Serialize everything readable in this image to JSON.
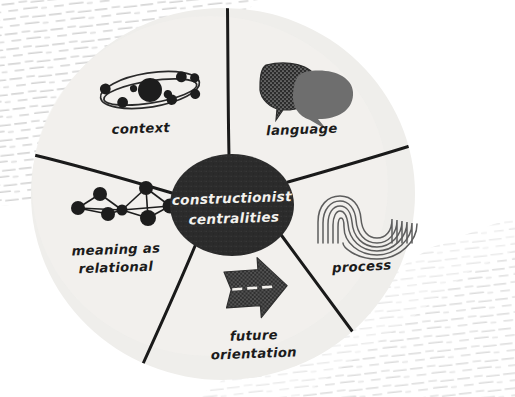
{
  "diagram": {
    "title": "constructionist centralities",
    "type": "radial-wheel-diagram",
    "hub": {
      "line1": "constructionist",
      "line2": "centralities",
      "fill_color": "#2b2b2b",
      "text_color": "#f4f2ee"
    },
    "wheel": {
      "fill_color": "#efeeeb",
      "segment_count": 5,
      "spoke_color": "#1a1a1a"
    },
    "background": {
      "paper_color": "#ffffff",
      "texture_name": "hand-drawn-dash-hatching",
      "texture_color": "#d8d8d8"
    },
    "segments": [
      {
        "id": "context",
        "label": "context",
        "icon_name": "atom-orbit-icon",
        "label_x": 141,
        "label_y": 133,
        "accent_color": "#1b1b1b"
      },
      {
        "id": "language",
        "label": "language",
        "icon_name": "speech-bubbles-icon",
        "label_x": 302,
        "label_y": 133,
        "accent_color": "#6e6e6e"
      },
      {
        "id": "process",
        "label": "process",
        "icon_name": "nested-wave-contours-icon",
        "label_x": 362,
        "label_y": 270,
        "accent_color": "#5a5a5a"
      },
      {
        "id": "future-orientation",
        "label_line1": "future",
        "label_line2": "orientation",
        "icon_name": "right-arrow-icon",
        "label_x": 254,
        "label_y": 339,
        "accent_color": "#2b2b2b"
      },
      {
        "id": "meaning-as-relational",
        "label_line1": "meaning as",
        "label_line2": "relational",
        "icon_name": "network-graph-icon",
        "label_x": 116,
        "label_y": 253,
        "accent_color": "#1b1b1b"
      }
    ]
  }
}
